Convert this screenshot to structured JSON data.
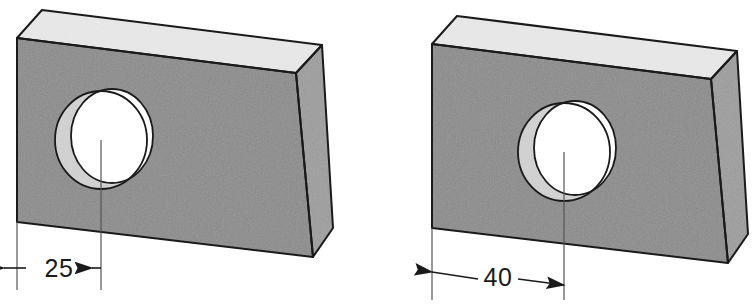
{
  "figure": {
    "type": "technical-illustration",
    "projection": "isometric",
    "caption": "",
    "background_color": "#ffffff",
    "object_count": 2
  },
  "palette": {
    "top_face": "#e9e9e9",
    "front_face": "#8b8b8b",
    "side_face": "#9d9d9d",
    "bore_face": "#d2d2d2",
    "hole_opening": "#ffffff",
    "outline": "#1a1a1a",
    "centerline": "#55555a",
    "dimension_line": "#1a1a1a",
    "text": "#1a1a1a"
  },
  "blocks": [
    {
      "id": "left-block",
      "name": "block-25",
      "hole_dimension_value": "25",
      "hole_dimension_units": "",
      "arrow_style": "outward",
      "front_face": {
        "top_left": [
          17,
          38
        ],
        "top_right": [
          296,
          73
        ],
        "bottom_right": [
          313,
          257
        ],
        "bottom_left": [
          17,
          222
        ]
      },
      "top_face": {
        "front_left": [
          17,
          38
        ],
        "back_left": [
          42,
          10
        ],
        "back_right": [
          322,
          45
        ],
        "front_right": [
          296,
          73
        ]
      },
      "side_face": {
        "front_top": [
          296,
          73
        ],
        "back_top": [
          322,
          45
        ],
        "back_bottom": [
          333,
          228
        ],
        "front_bottom": [
          313,
          257
        ]
      },
      "hole": {
        "center": [
          101,
          140
        ],
        "radius_x": 46,
        "radius_y": 49,
        "opening_center": [
          112,
          136
        ],
        "opening_radius_x": 41,
        "opening_radius_y": 47
      },
      "centerline": {
        "x": 101,
        "y_top": 140,
        "y_bottom": 290
      },
      "dimension": {
        "y": 268,
        "x_start": 17,
        "x_end": 101,
        "label": "25",
        "label_x": 59,
        "label_y": 277,
        "extension_left_x": 17,
        "extension_left_y_top": 222,
        "extension_left_y_bottom": 290
      }
    },
    {
      "id": "right-block",
      "name": "block-40",
      "hole_dimension_value": "40",
      "hole_dimension_units": "",
      "arrow_style": "inward",
      "front_face": {
        "top_left": [
          432,
          44
        ],
        "top_right": [
          711,
          79
        ],
        "bottom_right": [
          728,
          263
        ],
        "bottom_left": [
          432,
          228
        ]
      },
      "top_face": {
        "front_left": [
          432,
          44
        ],
        "back_left": [
          457,
          16
        ],
        "back_right": [
          737,
          51
        ],
        "front_right": [
          711,
          79
        ]
      },
      "side_face": {
        "front_top": [
          711,
          79
        ],
        "back_top": [
          737,
          51
        ],
        "back_bottom": [
          748,
          234
        ],
        "front_bottom": [
          728,
          263
        ]
      },
      "hole": {
        "center": [
          564,
          152
        ],
        "radius_x": 46,
        "radius_y": 49,
        "opening_center": [
          575,
          148
        ],
        "opening_radius_x": 41,
        "opening_radius_y": 47
      },
      "centerline": {
        "x": 564,
        "y_top": 152,
        "y_bottom": 300
      },
      "dimension": {
        "y": 277,
        "x_start": 432,
        "x_end": 564,
        "label": "40",
        "label_x": 498,
        "label_y": 286,
        "extension_left_x": 432,
        "extension_left_y_top": 228,
        "extension_left_y_bottom": 300
      }
    }
  ]
}
